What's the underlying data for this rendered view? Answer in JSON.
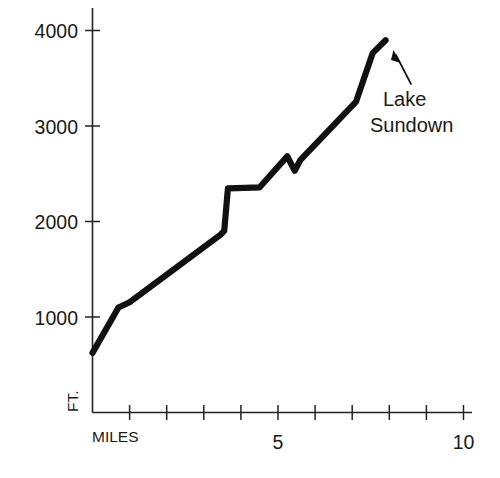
{
  "figure": {
    "background_color": "#ffffff",
    "line_color": "#111111",
    "axis_color": "#222222",
    "text_color": "#1a1a1a"
  },
  "chart_data": {
    "type": "line",
    "title": "",
    "subtitle": "",
    "xlabel": "MILES",
    "ylabel": "FT.",
    "xlim": [
      0,
      10
    ],
    "ylim": [
      0,
      4200
    ],
    "grid": false,
    "legend": false,
    "legend_position": "none",
    "x_ticks": [
      1,
      2,
      3,
      4,
      5,
      6,
      7,
      8,
      9,
      10
    ],
    "x_tick_labels": [
      "",
      "",
      "",
      "",
      "5",
      "",
      "",
      "",
      "",
      "10"
    ],
    "y_ticks": [
      1000,
      2000,
      3000,
      4000
    ],
    "y_tick_labels": [
      "1000",
      "2000",
      "3000",
      "4000"
    ],
    "series": [
      {
        "name": "Trail elevation profile",
        "x": [
          0.0,
          0.7,
          1.0,
          3.45,
          3.55,
          3.65,
          4.1,
          4.5,
          5.25,
          5.45,
          5.6,
          7.1,
          7.55,
          7.9
        ],
        "values": [
          625,
          1100,
          1155,
          1860,
          1900,
          2345,
          2350,
          2355,
          2680,
          2530,
          2640,
          3250,
          3760,
          3895
        ]
      }
    ],
    "annotations": [
      {
        "label_line_1": "Lake",
        "label_line_2": "Sundown",
        "points_to_x": 7.9,
        "points_to_y": 3895
      }
    ]
  },
  "axis_labels": {
    "y_axis_name": "FT.",
    "x_axis_name": "MILES",
    "y_4000": "4000",
    "y_3000": "3000",
    "y_2000": "2000",
    "y_1000": "1000",
    "x_5": "5",
    "x_10": "10"
  },
  "annotation": {
    "line_1": "Lake",
    "line_2": "Sundown"
  }
}
